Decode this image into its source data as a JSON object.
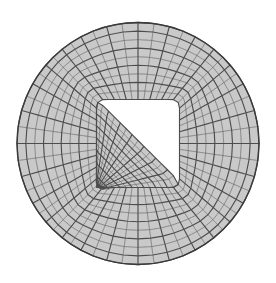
{
  "figure": {
    "name": "circular-butterfly-mesh",
    "background_color": "#ffffff",
    "cell_fill_color": "#c9c9c9",
    "grid_line_color": "#4d4d4d",
    "outline_color": "#3a3a3a"
  },
  "chart_data": {
    "type": "diagram",
    "geometry": {
      "shape": "circle",
      "center_x": 138,
      "center_y": 143.5,
      "radius": 121
    },
    "core_block": {
      "description": "central Cartesian block",
      "half_width": 41.5,
      "half_height": 44,
      "corner_rounding": 7,
      "divisions_x": 14,
      "divisions_y": 14
    },
    "o_grid": {
      "description": "four curved transition blocks between core block and circle",
      "radial_divisions": 9,
      "angular_divisions_per_side": 14,
      "radial_stretch": 1.0
    },
    "line_weights": {
      "fine": 0.55,
      "heavy": 1.15,
      "heavy_every_n": 2,
      "boundary": 1.3
    }
  }
}
